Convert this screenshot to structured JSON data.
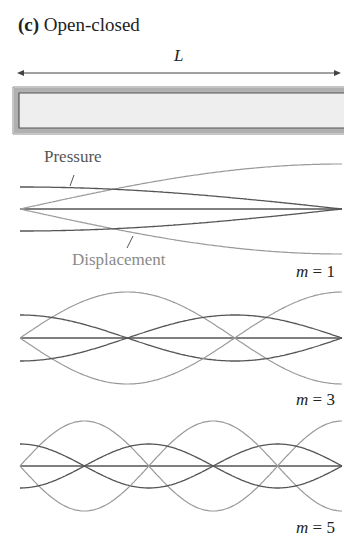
{
  "figure": {
    "panel_letter": "(c)",
    "title": "Open-closed",
    "length_label": "L",
    "tube": {
      "closed_end": "left",
      "open_end": "right"
    },
    "labels": {
      "pressure": "Pressure",
      "displacement": "Displacement"
    },
    "colors": {
      "pressure": "#555555",
      "displacement": "#9a9a9a",
      "axis": "#555555",
      "tube_wall": "#8c8c8c",
      "tube_fill": "#eeeeee"
    },
    "modes": [
      {
        "m_label": "m = 1",
        "m_var": "m",
        "m_value": "1",
        "cy": 209,
        "p_amp": 22,
        "d_amp": 45
      },
      {
        "m_label": "m = 3",
        "m_var": "m",
        "m_value": "3",
        "cy": 338,
        "p_amp": 23,
        "d_amp": 46
      },
      {
        "m_label": "m = 5",
        "m_var": "m",
        "m_value": "5",
        "cy": 466,
        "p_amp": 22,
        "d_amp": 45
      }
    ],
    "x_start": 20,
    "x_end": 342
  }
}
